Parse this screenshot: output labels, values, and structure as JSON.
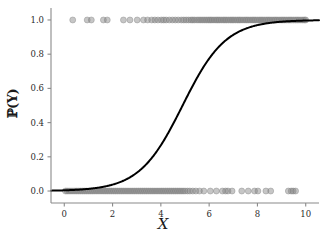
{
  "chart_data": {
    "type": "scatter",
    "title": "",
    "xlabel": "X",
    "ylabel": "P(Y)",
    "ylabel_display": "ℙ(Y)",
    "xlim": [
      -0.55,
      10.55
    ],
    "ylim": [
      -0.07,
      1.07
    ],
    "grid": false,
    "legend": null,
    "xticks": [
      0,
      2,
      4,
      6,
      8,
      10
    ],
    "xtick_labels": [
      "0",
      "2",
      "4",
      "6",
      "8",
      "10"
    ],
    "yticks": [
      0.0,
      0.2,
      0.4,
      0.6,
      0.8,
      1.0
    ],
    "ytick_labels": [
      "0.0",
      "0.2",
      "0.4",
      "0.6",
      "0.8",
      "1.0"
    ],
    "series": [
      {
        "name": "logistic-fit",
        "type": "line",
        "color": "#000000",
        "linewidth": 2.0,
        "model": "logistic",
        "midpoint_x0": 4.9,
        "slope_k": 1.12,
        "description": "P(Y)=1/(1+exp(-1.12*(x-4.9)))"
      },
      {
        "name": "observations-y1",
        "type": "scatter",
        "color": "#808080",
        "opacity": 0.45,
        "marker": "o",
        "y": 1.0,
        "x": [
          0.35,
          0.95,
          1.12,
          1.62,
          1.78,
          2.45,
          2.72,
          3.02,
          3.28,
          3.45,
          3.62,
          3.75,
          3.88,
          4.02,
          4.12,
          4.22,
          4.35,
          4.48,
          4.6,
          4.72,
          4.85,
          4.95,
          5.05,
          5.15,
          5.25,
          5.32,
          5.4,
          5.5,
          5.58,
          5.66,
          5.74,
          5.82,
          5.9,
          5.98,
          6.05,
          6.12,
          6.2,
          6.28,
          6.35,
          6.42,
          6.5,
          6.58,
          6.65,
          6.72,
          6.8,
          6.88,
          6.95,
          7.02,
          7.1,
          7.18,
          7.25,
          7.32,
          7.4,
          7.48,
          7.55,
          7.62,
          7.7,
          7.78,
          7.85,
          7.92,
          8.0,
          8.08,
          8.15,
          8.22,
          8.3,
          8.38,
          8.45,
          8.52,
          8.6,
          8.68,
          8.75,
          8.82,
          8.9,
          8.98,
          9.05,
          9.12,
          9.2,
          9.28,
          9.35,
          9.42,
          9.5,
          9.58,
          9.65,
          9.72,
          9.8,
          9.88,
          9.95,
          10.0
        ]
      },
      {
        "name": "observations-y0",
        "type": "scatter",
        "color": "#808080",
        "opacity": 0.45,
        "marker": "o",
        "y": 0.0,
        "x": [
          0.05,
          0.12,
          0.2,
          0.28,
          0.36,
          0.44,
          0.52,
          0.6,
          0.68,
          0.76,
          0.84,
          0.92,
          1.0,
          1.08,
          1.16,
          1.24,
          1.32,
          1.4,
          1.48,
          1.56,
          1.64,
          1.72,
          1.8,
          1.88,
          1.96,
          2.04,
          2.12,
          2.2,
          2.28,
          2.36,
          2.44,
          2.52,
          2.6,
          2.68,
          2.76,
          2.84,
          2.92,
          3.0,
          3.08,
          3.16,
          3.24,
          3.32,
          3.4,
          3.48,
          3.56,
          3.64,
          3.72,
          3.8,
          3.88,
          3.96,
          4.04,
          4.12,
          4.2,
          4.28,
          4.36,
          4.44,
          4.52,
          4.6,
          4.68,
          4.76,
          4.84,
          4.92,
          5.0,
          5.1,
          5.2,
          5.32,
          5.45,
          5.6,
          5.78,
          6.05,
          6.3,
          6.55,
          6.68,
          6.78,
          6.95,
          7.35,
          7.62,
          7.88,
          8.02,
          8.35,
          8.55,
          9.28,
          9.4,
          9.48,
          9.58
        ]
      }
    ]
  },
  "axes": {
    "spine_color": "#8a8a8a",
    "tick_color": "#8a8a8a",
    "background": "#ffffff"
  }
}
